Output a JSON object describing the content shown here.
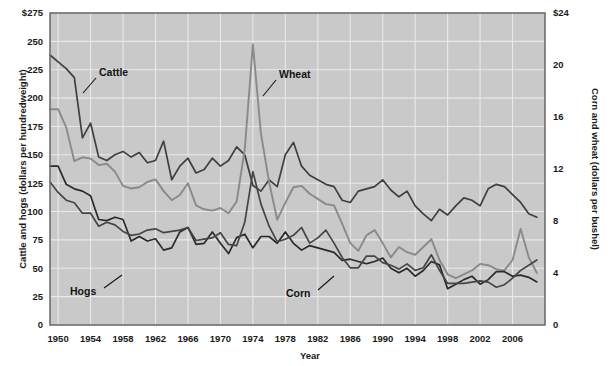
{
  "chart_data": {
    "type": "line",
    "title": "",
    "subtitle": "",
    "xlabel": "Year",
    "ylabel_left": "Cattle and hogs (dollars per hundredweight)",
    "ylabel_right": "Corn and wheat (dollars per bushel)",
    "grid": true,
    "legend_position": "inline-annotations",
    "xlim": [
      1949,
      2010
    ],
    "ylim_left": [
      0,
      275
    ],
    "ylim_right": [
      0,
      24
    ],
    "xticks": [
      1950,
      1954,
      1958,
      1962,
      1966,
      1970,
      1974,
      1978,
      1982,
      1986,
      1990,
      1994,
      1998,
      2002,
      2006
    ],
    "yticks_left": [
      "$275",
      "250",
      "225",
      "200",
      "175",
      "150",
      "125",
      "100",
      "75",
      "50",
      "25",
      "0"
    ],
    "yticks_left_values": [
      275,
      250,
      225,
      200,
      175,
      150,
      125,
      100,
      75,
      50,
      25,
      0
    ],
    "yticks_right": [
      "$24",
      "20",
      "16",
      "12",
      "8",
      "4",
      "0"
    ],
    "yticks_right_values": [
      24,
      20,
      16,
      12,
      8,
      4,
      0
    ],
    "x": [
      1949,
      1950,
      1951,
      1952,
      1953,
      1954,
      1955,
      1956,
      1957,
      1958,
      1959,
      1960,
      1961,
      1962,
      1963,
      1964,
      1965,
      1966,
      1967,
      1968,
      1969,
      1970,
      1971,
      1972,
      1973,
      1974,
      1975,
      1976,
      1977,
      1978,
      1979,
      1980,
      1981,
      1982,
      1983,
      1984,
      1985,
      1986,
      1987,
      1988,
      1989,
      1990,
      1991,
      1992,
      1993,
      1994,
      1995,
      1996,
      1997,
      1998,
      1999,
      2000,
      2001,
      2002,
      2003,
      2004,
      2005,
      2006,
      2007,
      2008,
      2009
    ],
    "series": [
      {
        "name": "Cattle",
        "axis": "left",
        "units": "dollars per hundredweight",
        "color": "#3f3f3f",
        "values": [
          238,
          232,
          226,
          218,
          165,
          178,
          148,
          145,
          150,
          153,
          148,
          152,
          143,
          145,
          162,
          128,
          140,
          147,
          134,
          137,
          147,
          140,
          145,
          157,
          150,
          123,
          118,
          128,
          122,
          150,
          161,
          140,
          132,
          128,
          124,
          122,
          110,
          108,
          118,
          120,
          122,
          128,
          119,
          113,
          118,
          105,
          98,
          92,
          102,
          97,
          105,
          112,
          110,
          105,
          120,
          124,
          122,
          115,
          108,
          98,
          95
        ]
      },
      {
        "name": "Wheat",
        "axis": "right",
        "units": "dollars per bushel",
        "color": "#8a8a8a",
        "values": [
          16.6,
          16.6,
          15.2,
          12.6,
          12.9,
          12.8,
          12.3,
          12.4,
          11.8,
          10.7,
          10.5,
          10.6,
          11.0,
          11.2,
          10.3,
          9.6,
          10.0,
          10.9,
          9.2,
          8.9,
          8.8,
          9.0,
          8.6,
          9.5,
          13.5,
          21.6,
          14.7,
          11.0,
          8.1,
          9.4,
          10.6,
          10.7,
          10.1,
          9.7,
          9.3,
          9.2,
          7.8,
          6.3,
          5.7,
          6.9,
          7.3,
          6.3,
          5.2,
          6.0,
          5.6,
          5.4,
          6.0,
          6.6,
          5.0,
          3.9,
          3.6,
          3.9,
          4.2,
          4.7,
          4.6,
          4.3,
          4.2,
          5.0,
          7.4,
          5.2,
          4.0
        ]
      },
      {
        "name": "Hogs",
        "axis": "left",
        "units": "dollars per hundredweight",
        "color": "#2a2a2a",
        "values": [
          140,
          140,
          124,
          120,
          118,
          114,
          93,
          92,
          95,
          93,
          74,
          78,
          74,
          76,
          66,
          68,
          82,
          86,
          71,
          72,
          82,
          72,
          63,
          77,
          80,
          68,
          78,
          78,
          72,
          82,
          72,
          66,
          70,
          68,
          66,
          64,
          57,
          58,
          56,
          54,
          56,
          59,
          50,
          46,
          50,
          43,
          48,
          56,
          53,
          32,
          36,
          40,
          43,
          36,
          40,
          47,
          47,
          43,
          44,
          42,
          38
        ]
      },
      {
        "name": "Corn",
        "axis": "right",
        "units": "dollars per bushel",
        "color": "#454545",
        "values": [
          11.0,
          10.2,
          9.6,
          9.4,
          8.6,
          8.6,
          7.6,
          7.9,
          7.7,
          7.2,
          6.9,
          7.0,
          7.3,
          7.4,
          7.1,
          7.2,
          7.3,
          7.5,
          6.5,
          6.6,
          6.7,
          7.1,
          6.2,
          6.1,
          7.9,
          11.8,
          9.3,
          7.6,
          6.4,
          6.6,
          6.9,
          7.5,
          6.3,
          6.7,
          7.3,
          6.3,
          5.2,
          4.4,
          4.4,
          5.3,
          5.3,
          4.8,
          4.6,
          4.3,
          4.7,
          4.2,
          4.4,
          5.4,
          4.2,
          3.2,
          3.2,
          3.2,
          3.3,
          3.4,
          3.3,
          2.9,
          3.1,
          3.6,
          4.2,
          4.6,
          5.0
        ]
      }
    ],
    "annotations": [
      {
        "text": "Cattle",
        "series": "Cattle"
      },
      {
        "text": "Wheat",
        "series": "Wheat"
      },
      {
        "text": "Hogs",
        "series": "Hogs"
      },
      {
        "text": "Corn",
        "series": "Corn"
      }
    ]
  },
  "colors": {
    "plot_background": "#c9c9c9",
    "gridline": "#e9e9e9",
    "border": "#6e6e6e",
    "text": "#141414"
  }
}
